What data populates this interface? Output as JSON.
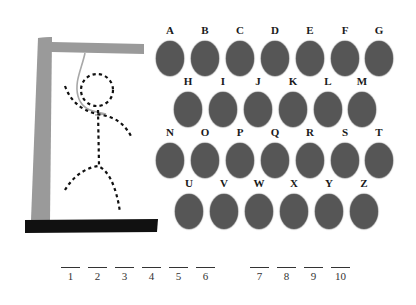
{
  "game": {
    "title": "Hangman",
    "colors": {
      "gallows": "#9a9a9a",
      "base": "#111111",
      "rope": "#a8a8a8",
      "figure": "#111111",
      "key_disc": "#565656",
      "key_label": "#1a1a1a"
    }
  },
  "keyboard": {
    "rows": [
      {
        "keys": [
          {
            "letter": "A",
            "x": 156,
            "y": 24
          },
          {
            "letter": "B",
            "x": 191,
            "y": 24
          },
          {
            "letter": "C",
            "x": 226,
            "y": 24
          },
          {
            "letter": "D",
            "x": 261,
            "y": 24
          },
          {
            "letter": "E",
            "x": 296,
            "y": 24
          },
          {
            "letter": "F",
            "x": 331,
            "y": 24
          },
          {
            "letter": "G",
            "x": 365,
            "y": 24
          }
        ]
      },
      {
        "keys": [
          {
            "letter": "H",
            "x": 174,
            "y": 75
          },
          {
            "letter": "I",
            "x": 209,
            "y": 75
          },
          {
            "letter": "J",
            "x": 244,
            "y": 75
          },
          {
            "letter": "K",
            "x": 279,
            "y": 75
          },
          {
            "letter": "L",
            "x": 314,
            "y": 75
          },
          {
            "letter": "M",
            "x": 348,
            "y": 75
          }
        ]
      },
      {
        "keys": [
          {
            "letter": "N",
            "x": 156,
            "y": 126
          },
          {
            "letter": "O",
            "x": 191,
            "y": 126
          },
          {
            "letter": "P",
            "x": 226,
            "y": 126
          },
          {
            "letter": "Q",
            "x": 261,
            "y": 126
          },
          {
            "letter": "R",
            "x": 296,
            "y": 126
          },
          {
            "letter": "S",
            "x": 331,
            "y": 126
          },
          {
            "letter": "T",
            "x": 365,
            "y": 126
          }
        ]
      },
      {
        "keys": [
          {
            "letter": "U",
            "x": 175,
            "y": 177
          },
          {
            "letter": "V",
            "x": 210,
            "y": 177
          },
          {
            "letter": "W",
            "x": 245,
            "y": 177
          },
          {
            "letter": "X",
            "x": 280,
            "y": 177
          },
          {
            "letter": "Y",
            "x": 315,
            "y": 177
          },
          {
            "letter": "Z",
            "x": 350,
            "y": 177
          }
        ]
      }
    ]
  },
  "word": {
    "blanks": [
      {
        "number": "1",
        "value": "",
        "x": 61
      },
      {
        "number": "2",
        "value": "",
        "x": 88
      },
      {
        "number": "3",
        "value": "",
        "x": 115
      },
      {
        "number": "4",
        "value": "",
        "x": 142
      },
      {
        "number": "5",
        "value": "",
        "x": 169
      },
      {
        "number": "6",
        "value": "",
        "x": 196
      },
      {
        "number": "7",
        "value": "",
        "x": 250
      },
      {
        "number": "8",
        "value": "",
        "x": 277
      },
      {
        "number": "9",
        "value": "",
        "x": 304
      },
      {
        "number": "10",
        "value": "",
        "x": 331
      }
    ],
    "line_y": 267
  }
}
